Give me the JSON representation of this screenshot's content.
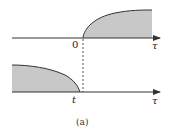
{
  "diagram": {
    "caption": "(a)",
    "colors": {
      "fill": "#c8c8c8",
      "stroke": "#333333",
      "dashed": "#555555"
    },
    "top_panel": {
      "axis_label": "τ",
      "origin_label": "0",
      "description": "shaded region for τ > 0 bounded by a rising concave curve"
    },
    "bottom_panel": {
      "axis_label": "τ",
      "point_label": "t",
      "description": "shaded region for τ < t bounded by a falling curve reaching the axis at t"
    },
    "dashed_line": "vertical dashed line at τ = 0 / τ = t alignment"
  }
}
